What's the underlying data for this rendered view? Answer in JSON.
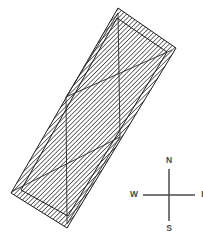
{
  "figure": {
    "background_color": "#ffffff",
    "width": 203,
    "height": 241
  },
  "plan": {
    "name": "hatched-parallelogram-outline",
    "wall_color": "#1d1d1d",
    "wall_fill": "#ffffff",
    "wall_hatch_color": "#1d1d1d",
    "interior_line_color": "#2a2a2a",
    "outer_polygon": "118,8 176,48 67,228 11,193",
    "inner_polygon": "117,18 167,52 68,216 21,190",
    "interior_lines": [
      {
        "name": "vertical-line-upper",
        "x1": 118,
        "y1": 13,
        "x2": 120,
        "y2": 137
      },
      {
        "name": "vertical-line-lower",
        "x1": 66,
        "y1": 97,
        "x2": 67,
        "y2": 223
      },
      {
        "name": "diagonal-upper",
        "x1": 66,
        "y1": 97,
        "x2": 172,
        "y2": 50
      },
      {
        "name": "diagonal-lower",
        "x1": 13,
        "y1": 191,
        "x2": 120,
        "y2": 137
      },
      {
        "name": "cross-brace-lower-right",
        "x1": 120,
        "y1": 137,
        "x2": 67,
        "y2": 224
      },
      {
        "name": "cross-brace-upper-left",
        "x1": 66,
        "y1": 97,
        "x2": 118,
        "y2": 13
      }
    ]
  },
  "compass": {
    "name": "compass-rose",
    "center_x": 169,
    "center_y": 195,
    "arm_length": 26,
    "stroke_color": "#4a4a4a",
    "label_color": "#4a4a4a",
    "labels": {
      "north": "N",
      "east": "E",
      "south": "S",
      "west": "W"
    }
  }
}
